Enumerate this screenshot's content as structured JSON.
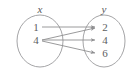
{
  "diagram": {
    "type": "mapping-diagram",
    "domain_set": {
      "label": "x",
      "elements": [
        "1",
        "4"
      ]
    },
    "range_set": {
      "label": "y",
      "elements": [
        "2",
        "4",
        "6"
      ]
    },
    "mappings": [
      {
        "from": "1",
        "to": "2"
      },
      {
        "from": "4",
        "to": "2"
      },
      {
        "from": "4",
        "to": "4"
      },
      {
        "from": "4",
        "to": "6"
      }
    ],
    "colors": {
      "stroke": "#9a9a9c",
      "arrow": "#8e8e90",
      "text": "#5d5d5f",
      "background": "#ffffff"
    }
  }
}
